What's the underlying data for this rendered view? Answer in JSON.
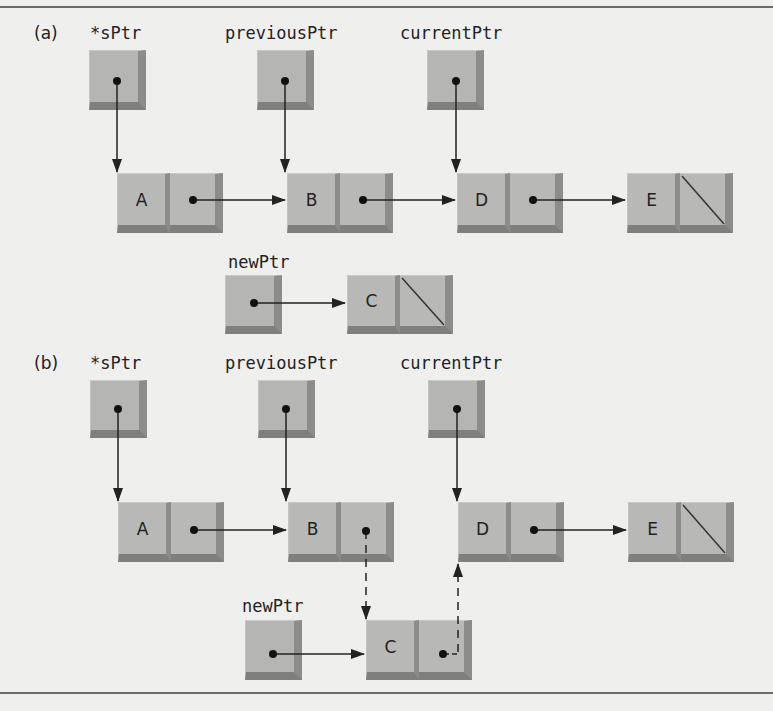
{
  "panels": [
    {
      "label": "(a)",
      "pointers": [
        "*sPtr",
        "previousPtr",
        "currentPtr"
      ],
      "new_pointer": "newPtr",
      "list_nodes": [
        "A",
        "B",
        "D",
        "E"
      ],
      "new_node": "C",
      "description": "Before insertion: previousPtr points to B, currentPtr points to D; newPtr points to new node C whose next is NULL"
    },
    {
      "label": "(b)",
      "pointers": [
        "*sPtr",
        "previousPtr",
        "currentPtr"
      ],
      "new_pointer": "newPtr",
      "list_nodes": [
        "A",
        "B",
        "D",
        "E"
      ],
      "new_node": "C",
      "description": "After insertion: B's link points to C (dashed), C's link points to D (dashed)"
    }
  ],
  "colors": {
    "background": "#efefed",
    "box_face": "#b5b5b3",
    "box_shadow": "#7f7f7d",
    "arrow": "#222222"
  }
}
